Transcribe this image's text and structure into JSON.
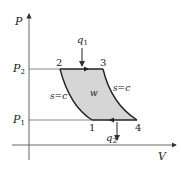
{
  "top_clipped_text": "--- ---- ---",
  "axes": {
    "y_label": "P",
    "x_label": "V",
    "p_high_label": "P",
    "p_high_sub": "2",
    "p_low_label": "P",
    "p_low_sub": "1"
  },
  "points": [
    {
      "id": "1",
      "label": "1"
    },
    {
      "id": "2",
      "label": "2"
    },
    {
      "id": "3",
      "label": "3"
    },
    {
      "id": "4",
      "label": "4"
    }
  ],
  "heat": {
    "in_label": "q",
    "in_sub": "1",
    "out_label": "q",
    "out_sub": "2"
  },
  "curves": {
    "left_isentrope": "s=c",
    "right_isentrope": "s=c"
  },
  "work_label": "w",
  "colors": {
    "fill": "#d6d6d6",
    "stroke": "#222222",
    "axis": "#555555"
  }
}
